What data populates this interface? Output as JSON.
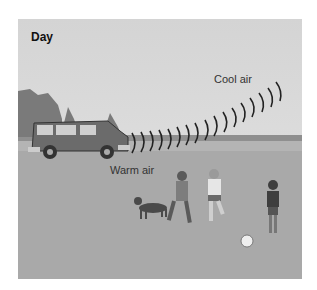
{
  "figure": {
    "title": "Day",
    "labels": {
      "cool_air": "Cool air",
      "warm_air": "Warm air"
    }
  }
}
